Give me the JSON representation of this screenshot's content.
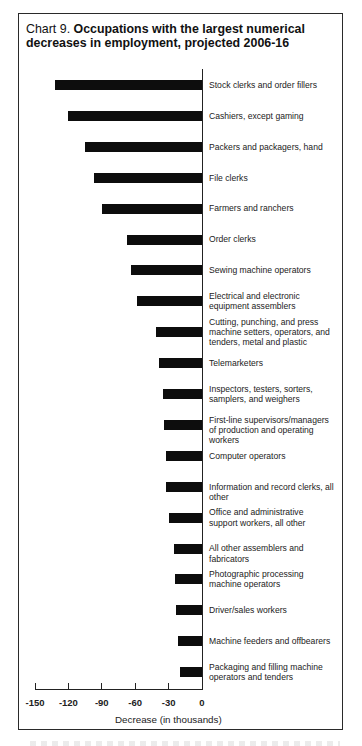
{
  "chart_data": {
    "type": "bar",
    "orientation": "horizontal",
    "title_prefix": "Chart 9.",
    "title": "Occupations with the largest numerical decreases in employment, projected 2006-16",
    "xlabel": "Decrease (in thousands)",
    "ylabel": "",
    "xlim": [
      -150,
      0
    ],
    "xticks": [
      "-150",
      "-120",
      "-90",
      "-60",
      "-30",
      "0"
    ],
    "grid": false,
    "legend": null,
    "bar_color": "#0d0d0d",
    "categories": [
      "Stock clerks and order fillers",
      "Cashiers, except gaming",
      "Packers and packagers, hand",
      "File clerks",
      "Farmers and ranchers",
      "Order clerks",
      "Sewing machine operators",
      "Electrical and electronic\nequipment assemblers",
      "Cutting, punching, and press\nmachine setters, operators, and\ntenders, metal and plastic",
      "Telemarketers",
      "Inspectors, testers, sorters,\nsamplers, and weighers",
      "First-line supervisors/managers\nof production and operating workers",
      "Computer operators",
      "Information and record clerks, all other",
      "Office and administrative\nsupport workers, all other",
      "All other assemblers and fabricators",
      "Photographic processing\nmachine operators",
      "Driver/sales workers",
      "Machine feeders and offbearers",
      "Packaging and filling machine\noperators and tenders"
    ],
    "values": [
      -132,
      -120,
      -105,
      -97,
      -90,
      -67,
      -64,
      -58,
      -41,
      -39,
      -35,
      -34,
      -32,
      -32,
      -30,
      -25,
      -24,
      -23,
      -22,
      -20
    ]
  }
}
